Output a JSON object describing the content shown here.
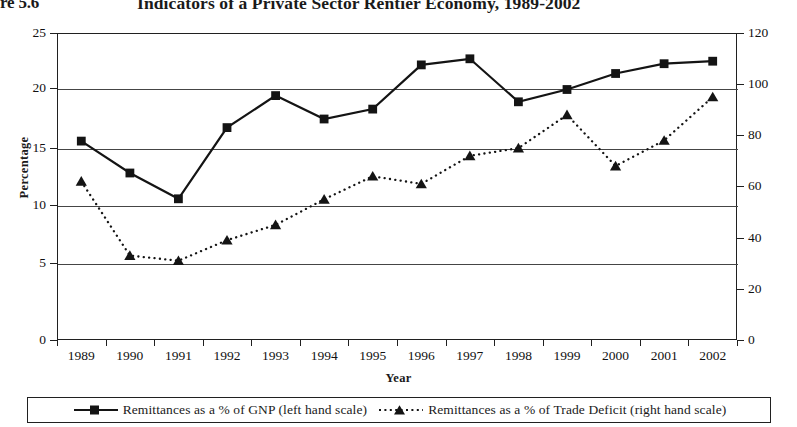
{
  "figure": {
    "number_label": "re 5.6",
    "title": "Indicators of a Private Sector Rentier Economy, 1989-2002"
  },
  "axes": {
    "x_title": "Year",
    "y_left_title": "Percentage",
    "y_left_ticks": [
      "0",
      "5",
      "10",
      "15",
      "20",
      "25"
    ],
    "y_right_ticks": [
      "0",
      "20",
      "40",
      "60",
      "80",
      "100",
      "120"
    ],
    "x_ticks": [
      "1989",
      "1990",
      "1991",
      "1992",
      "1993",
      "1994",
      "1995",
      "1996",
      "1997",
      "1998",
      "1999",
      "2000",
      "2001",
      "2002"
    ]
  },
  "legend": {
    "items": [
      {
        "marker": "square-solid-line",
        "label": "Remittances as a % of GNP (left hand scale)"
      },
      {
        "marker": "triangle-dotted-line",
        "label": "Remittances as a % of Trade Deficit (right hand scale)"
      }
    ]
  },
  "colors": {
    "line": "#141414",
    "grid": "#454545",
    "axis": "#202020",
    "background": "#ffffff"
  },
  "chart_data": {
    "type": "line",
    "title": "Indicators of a Private Sector Rentier Economy, 1989-2002",
    "xlabel": "Year",
    "ylabel": "Percentage",
    "grid": true,
    "legend_position": "bottom",
    "categories": [
      "1989",
      "1990",
      "1991",
      "1992",
      "1993",
      "1994",
      "1995",
      "1996",
      "1997",
      "1998",
      "1999",
      "2000",
      "2001",
      "2002"
    ],
    "ylim": [
      0,
      25
    ],
    "y2lim": [
      0,
      120
    ],
    "yticks": [
      0,
      5,
      10,
      15,
      20,
      25
    ],
    "y2ticks": [
      0,
      20,
      40,
      60,
      80,
      100,
      120
    ],
    "series": [
      {
        "name": "Remittances as a % of GNP (left hand scale)",
        "axis": "left",
        "marker": "square",
        "linestyle": "solid",
        "values": [
          16.2,
          13.6,
          11.5,
          17.3,
          19.9,
          18.0,
          18.8,
          22.4,
          22.9,
          19.4,
          20.4,
          21.7,
          22.5,
          22.7
        ]
      },
      {
        "name": "Remittances as a % of Trade Deficit (right hand scale)",
        "axis": "right",
        "marker": "triangle",
        "linestyle": "dotted",
        "values": [
          62,
          33,
          31,
          39,
          45,
          55,
          64,
          61,
          72,
          75,
          88,
          68,
          78,
          95
        ]
      }
    ]
  }
}
